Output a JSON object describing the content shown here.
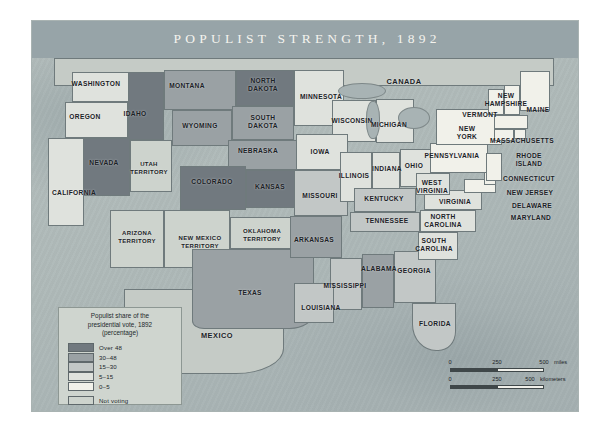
{
  "map": {
    "title": "POPULIST STRENGTH, 1892",
    "colors": {
      "header_band": "#97a4a8",
      "ocean": "#aeb9b8",
      "over_48": "#71797f",
      "c30_48": "#9aa1a4",
      "c15_30": "#c2c7c6",
      "c5_15": "#dfe2dd",
      "c0_5": "#f1f1ea",
      "not_voting": "#cdd3cd",
      "border": "#6f7a7c",
      "label_text": "#1b2226"
    },
    "legend": {
      "title_line1": "Populist share of the",
      "title_line2": "presidential vote, 1892",
      "title_line3": "(percentage)",
      "classes": [
        {
          "label": "Over 48",
          "color": "#71797f"
        },
        {
          "label": "30–48",
          "color": "#9aa1a4"
        },
        {
          "label": "15–30",
          "color": "#c2c7c6"
        },
        {
          "label": "5–15",
          "color": "#dfe2dd"
        },
        {
          "label": "0–5",
          "color": "#f1f1ea"
        },
        {
          "label": "Not voting",
          "color": "#cdd3cd"
        }
      ]
    },
    "scale": {
      "miles": {
        "t0": "0",
        "t1": "250",
        "t2": "500",
        "unit": "miles"
      },
      "kilometers": {
        "t0": "0",
        "t1": "250",
        "t2": "500",
        "unit": "kilometers"
      }
    },
    "neighbors": [
      {
        "name": "CANADA",
        "x": 372,
        "y": 61
      },
      {
        "name": "MEXICO",
        "x": 185,
        "y": 315
      }
    ],
    "places": [
      {
        "name": "WASHINGTON",
        "x": 64,
        "y": 63,
        "class": "c-5-15",
        "size": "n"
      },
      {
        "name": "OREGON",
        "x": 53,
        "y": 96,
        "class": "c-5-15",
        "size": "n"
      },
      {
        "name": "IDAHO",
        "x": 103,
        "y": 93,
        "class": "c-over48",
        "size": "n"
      },
      {
        "name": "MONTANA",
        "x": 155,
        "y": 65,
        "class": "c-30-48",
        "size": "n"
      },
      {
        "name": "NORTH\nDAKOTA",
        "x": 231,
        "y": 64,
        "class": "c-over48",
        "size": "n"
      },
      {
        "name": "MINNESOTA",
        "x": 289,
        "y": 76,
        "class": "c-5-15",
        "size": "n"
      },
      {
        "name": "WISCONSIN",
        "x": 320,
        "y": 100,
        "class": "c-5-15",
        "size": "n"
      },
      {
        "name": "SOUTH\nDAKOTA",
        "x": 231,
        "y": 101,
        "class": "c-30-48",
        "size": "n"
      },
      {
        "name": "WYOMING",
        "x": 168,
        "y": 105,
        "class": "c-30-48",
        "size": "n"
      },
      {
        "name": "NEBRASKA",
        "x": 226,
        "y": 130,
        "class": "c-30-48",
        "size": "n"
      },
      {
        "name": "IOWA",
        "x": 288,
        "y": 131,
        "class": "c-5-15",
        "size": "n"
      },
      {
        "name": "NEVADA",
        "x": 72,
        "y": 142,
        "class": "c-over48",
        "size": "n"
      },
      {
        "name": "UTAH\nTERRITORY",
        "x": 117,
        "y": 148,
        "class": "c-none",
        "size": "sm"
      },
      {
        "name": "COLORADO",
        "x": 180,
        "y": 161,
        "class": "c-over48",
        "size": "n"
      },
      {
        "name": "KANSAS",
        "x": 238,
        "y": 166,
        "class": "c-over48",
        "size": "n"
      },
      {
        "name": "MISSOURI",
        "x": 288,
        "y": 175,
        "class": "c-15-30",
        "size": "n"
      },
      {
        "name": "ILLINOIS",
        "x": 322,
        "y": 155,
        "class": "c-5-15",
        "size": "n"
      },
      {
        "name": "INDIANA",
        "x": 355,
        "y": 148,
        "class": "c-5-15",
        "size": "n"
      },
      {
        "name": "OHIO",
        "x": 382,
        "y": 145,
        "class": "c-5-15",
        "size": "n"
      },
      {
        "name": "MICHIGAN",
        "x": 357,
        "y": 104,
        "class": "c-5-15",
        "size": "n"
      },
      {
        "name": "KENTUCKY",
        "x": 352,
        "y": 178,
        "class": "c-15-30",
        "size": "n"
      },
      {
        "name": "TENNESSEE",
        "x": 355,
        "y": 200,
        "class": "c-15-30",
        "size": "n"
      },
      {
        "name": "CALIFORNIA",
        "x": 42,
        "y": 172,
        "class": "c-5-15",
        "size": "n"
      },
      {
        "name": "ARIZONA\nTERRITORY",
        "x": 105,
        "y": 217,
        "class": "c-none",
        "size": "sm"
      },
      {
        "name": "NEW MEXICO\nTERRITORY",
        "x": 168,
        "y": 222,
        "class": "c-none",
        "size": "sm"
      },
      {
        "name": "OKLAHOMA\nTERRITORY",
        "x": 230,
        "y": 215,
        "class": "c-none",
        "size": "sm"
      },
      {
        "name": "ARKANSAS",
        "x": 282,
        "y": 219,
        "class": "c-30-48",
        "size": "n"
      },
      {
        "name": "TEXAS",
        "x": 218,
        "y": 272,
        "class": "c-30-48",
        "size": "n"
      },
      {
        "name": "LOUISIANA",
        "x": 289,
        "y": 287,
        "class": "c-15-30",
        "size": "n"
      },
      {
        "name": "MISSISSIPPI",
        "x": 313,
        "y": 265,
        "class": "c-15-30",
        "size": "n"
      },
      {
        "name": "ALABAMA",
        "x": 347,
        "y": 248,
        "class": "c-30-48",
        "size": "n"
      },
      {
        "name": "GEORGIA",
        "x": 382,
        "y": 250,
        "class": "c-15-30",
        "size": "n"
      },
      {
        "name": "FLORIDA",
        "x": 403,
        "y": 303,
        "class": "c-15-30",
        "size": "n"
      },
      {
        "name": "SOUTH\nCAROLINA",
        "x": 402,
        "y": 224,
        "class": "c-5-15",
        "size": "n"
      },
      {
        "name": "NORTH\nCAROLINA",
        "x": 411,
        "y": 200,
        "class": "c-5-15",
        "size": "n"
      },
      {
        "name": "VIRGINIA",
        "x": 423,
        "y": 181,
        "class": "c-5-15",
        "size": "n"
      },
      {
        "name": "WEST\nVIRGINIA",
        "x": 400,
        "y": 166,
        "class": "c-5-15",
        "size": "n"
      },
      {
        "name": "PENNSYLVANIA",
        "x": 420,
        "y": 135,
        "class": "c-0-5",
        "size": "n"
      },
      {
        "name": "NEW\nYORK",
        "x": 435,
        "y": 112,
        "class": "c-0-5",
        "size": "n"
      },
      {
        "name": "VERMONT",
        "x": 448,
        "y": 94,
        "class": "c-0-5",
        "size": "n"
      },
      {
        "name": "NEW\nHAMPSHIRE",
        "x": 474,
        "y": 79,
        "class": "c-0-5",
        "size": "n"
      },
      {
        "name": "MAINE",
        "x": 506,
        "y": 89,
        "class": "c-0-5",
        "size": "n"
      },
      {
        "name": "MASSACHUSETTS",
        "x": 490,
        "y": 120,
        "class": "c-0-5",
        "size": "n"
      },
      {
        "name": "RHODE\nISLAND",
        "x": 497,
        "y": 139,
        "class": "c-0-5",
        "size": "n"
      },
      {
        "name": "CONNECTICUT",
        "x": 497,
        "y": 158,
        "class": "c-0-5",
        "size": "n"
      },
      {
        "name": "NEW JERSEY",
        "x": 498,
        "y": 172,
        "class": "c-0-5",
        "size": "n"
      },
      {
        "name": "DELAWARE",
        "x": 500,
        "y": 185,
        "class": "c-0-5",
        "size": "n"
      },
      {
        "name": "MARYLAND",
        "x": 499,
        "y": 197,
        "class": "c-0-5",
        "size": "n"
      }
    ]
  }
}
